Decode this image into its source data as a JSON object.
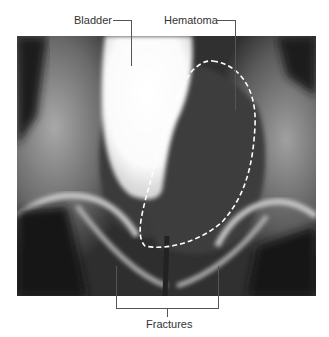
{
  "figure": {
    "type": "pelvic radiograph (cystogram)",
    "labels": {
      "bladder": "Bladder",
      "hematoma": "Hematoma",
      "fractures": "Fractures"
    },
    "colors": {
      "background": "#ffffff",
      "label_text": "#333333",
      "leader_line": "#555555",
      "outline_dash": "#ffffff"
    }
  }
}
